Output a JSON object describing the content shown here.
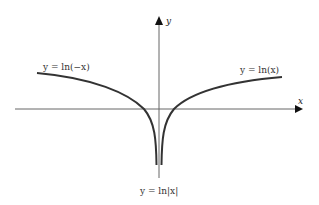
{
  "figure": {
    "type": "function-graph",
    "axes": {
      "x_label": "x",
      "y_label": "y"
    },
    "curves": [
      {
        "name": "ln-negative-x",
        "label": "y = ln(−x)",
        "domain": "x < 0"
      },
      {
        "name": "ln-x",
        "label": "y = ln(x)",
        "domain": "x > 0"
      }
    ],
    "combined_label": "y = ln|x|",
    "colors": {
      "curve": "#333333",
      "axis": "#555555",
      "background": "#ffffff"
    }
  }
}
